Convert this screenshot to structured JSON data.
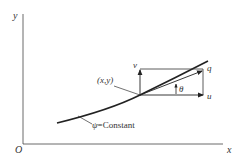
{
  "diagram": {
    "axes": {
      "origin_label": "O",
      "x_label": "x",
      "y_label": "y"
    },
    "labels": {
      "point": "(x,y)",
      "streamline_psi": "ψ",
      "streamline_rest": "=Constant",
      "v": "v",
      "u": "u",
      "q": "q",
      "theta": "θ"
    },
    "colors": {
      "line": "#222222",
      "background": "#ffffff"
    }
  }
}
